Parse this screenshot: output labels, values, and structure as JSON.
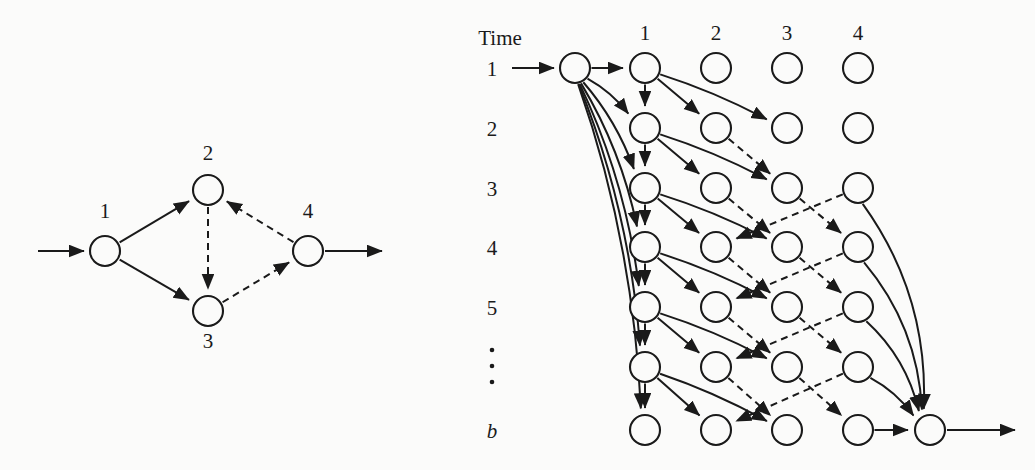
{
  "figure": {
    "background_color": "#fbfbfa",
    "ink_color": "#1a1a1a",
    "width": 1035,
    "height": 470
  },
  "left_graph": {
    "name": "state-transition-graph",
    "node_labels": [
      "1",
      "2",
      "3",
      "4"
    ],
    "nodes": [
      {
        "id": "1",
        "label": "1",
        "x": 105,
        "y": 251,
        "r": 15,
        "label_x": 100,
        "label_y": 218
      },
      {
        "id": "2",
        "label": "2",
        "x": 208,
        "y": 190,
        "r": 15,
        "label_x": 203,
        "label_y": 160
      },
      {
        "id": "3",
        "label": "3",
        "x": 208,
        "y": 311,
        "r": 15,
        "label_x": 203,
        "label_y": 348
      },
      {
        "id": "4",
        "label": "4",
        "x": 308,
        "y": 251,
        "r": 15,
        "label_x": 303,
        "label_y": 218
      }
    ],
    "edges": [
      {
        "from": "in",
        "to": "1",
        "style": "solid"
      },
      {
        "from": "1",
        "to": "2",
        "style": "solid"
      },
      {
        "from": "1",
        "to": "3",
        "style": "solid"
      },
      {
        "from": "2",
        "to": "3",
        "style": "dashed"
      },
      {
        "from": "3",
        "to": "4",
        "style": "dashed"
      },
      {
        "from": "4",
        "to": "2",
        "style": "dashed"
      },
      {
        "from": "4",
        "to": "out",
        "style": "solid"
      }
    ]
  },
  "right_trellis": {
    "name": "time-expanded-trellis",
    "axis_label": "Time",
    "row_labels": [
      "1",
      "2",
      "3",
      "4",
      "5",
      "⋮",
      "b"
    ],
    "row_label_kinds": [
      "num",
      "num",
      "num",
      "num",
      "num",
      "dots",
      "italic"
    ],
    "column_labels": [
      "1",
      "2",
      "3",
      "4"
    ],
    "row_y": [
      68,
      128,
      188,
      247,
      307,
      367,
      430
    ],
    "column_x": [
      645,
      716,
      787,
      858
    ],
    "start_node": {
      "x": 575,
      "y": 68,
      "r": 15
    },
    "terminal_node": {
      "x": 930,
      "y": 430,
      "r": 15
    },
    "node_radius": 15,
    "edge_styles": {
      "start_fanout": "solid",
      "col1_to_col1": "solid",
      "col1_to_col2": "solid",
      "col1_to_col3": "solid",
      "col2_to_col3": "dashed",
      "col3_to_col2": "dashed",
      "col3_to_col4": "dashed",
      "col4_to_col3": "dashed",
      "col4_to_terminal": "solid",
      "terminal_exit": "solid"
    }
  }
}
